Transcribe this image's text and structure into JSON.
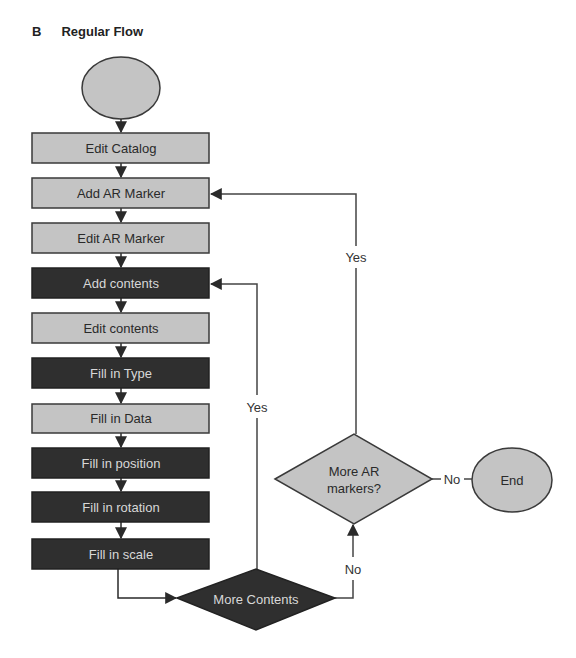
{
  "header": {
    "panel_letter": "B",
    "title": "Regular Flow"
  },
  "colors": {
    "light_fill": "#c4c4c4",
    "dark_fill": "#2f2f2f",
    "stroke": "#3a3a3a",
    "light_text": "#2a2a2a",
    "dark_text": "#d8d8d8",
    "line": "#444444"
  },
  "nodes": {
    "start": {
      "label": ""
    },
    "edit_catalog": {
      "label": "Edit Catalog",
      "style": "light"
    },
    "add_ar_marker": {
      "label": "Add AR Marker",
      "style": "light"
    },
    "edit_ar_marker": {
      "label": "Edit AR Marker",
      "style": "light"
    },
    "add_contents": {
      "label": "Add contents",
      "style": "dark"
    },
    "edit_contents": {
      "label": "Edit contents",
      "style": "light"
    },
    "fill_in_type": {
      "label": "Fill in Type",
      "style": "dark"
    },
    "fill_in_data": {
      "label": "Fill in Data",
      "style": "light"
    },
    "fill_in_position": {
      "label": "Fill in position",
      "style": "dark"
    },
    "fill_in_rotation": {
      "label": "Fill in rotation",
      "style": "dark"
    },
    "fill_in_scale": {
      "label": "Fill in scale",
      "style": "dark"
    },
    "more_contents": {
      "label": "More Contents",
      "style": "dark"
    },
    "more_ar_markers": {
      "label_line1": "More AR",
      "label_line2": "markers?",
      "style": "light"
    },
    "end": {
      "label": "End"
    }
  },
  "edges": {
    "more_contents_yes": "Yes",
    "more_contents_no": "No",
    "more_ar_markers_yes": "Yes",
    "more_ar_markers_no": "No"
  }
}
